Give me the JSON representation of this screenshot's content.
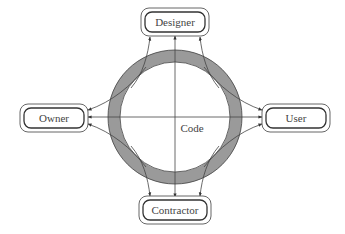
{
  "diagram": {
    "center_label": "Code",
    "nodes": {
      "top": "Designer",
      "left": "Owner",
      "right": "User",
      "bottom": "Contractor"
    },
    "ring": {
      "fill": "#9a9a9a",
      "stroke": "#444444"
    },
    "edges": [
      {
        "from": "Code",
        "to": "Designer",
        "count": 3
      },
      {
        "from": "Code",
        "to": "Owner",
        "count": 3
      },
      {
        "from": "Code",
        "to": "User",
        "count": 3
      },
      {
        "from": "Code",
        "to": "Contractor",
        "count": 3
      }
    ]
  }
}
